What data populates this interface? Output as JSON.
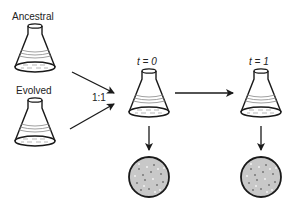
{
  "labels": {
    "ancestral": "Ancestral",
    "evolved": "Evolved",
    "ratio": "1:1",
    "t0": "t = 0",
    "t1": "t = 1"
  },
  "colors": {
    "stroke": "#1a1a1a",
    "plate_fill": "#c8c8c8",
    "liquid_line": "#888888"
  },
  "diagram": {
    "nodes": [
      "Ancestral flask",
      "Evolved flask",
      "Mixed flask t=0",
      "Flask t=1",
      "Plate t=0",
      "Plate t=1"
    ],
    "edges": [
      [
        "Ancestral flask",
        "Mixed flask t=0"
      ],
      [
        "Evolved flask",
        "Mixed flask t=0"
      ],
      [
        "Mixed flask t=0",
        "Flask t=1"
      ],
      [
        "Mixed flask t=0",
        "Plate t=0"
      ],
      [
        "Flask t=1",
        "Plate t=1"
      ]
    ]
  }
}
